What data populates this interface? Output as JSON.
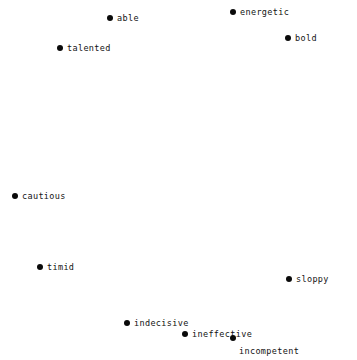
{
  "chart_data": {
    "type": "scatter",
    "title": "",
    "subtitle": "",
    "xlabel": "",
    "ylabel": "",
    "xlim": [
      0,
      357
    ],
    "ylim": [
      0,
      360
    ],
    "grid": false,
    "legend": "none",
    "axes_visible": false,
    "background_color": "#ffffff",
    "marker_color": "#0a0a0a",
    "marker_size_px": 6,
    "label_color": "#131313",
    "points": [
      {
        "label": "able",
        "x": 110,
        "y": 18,
        "label_position": "right"
      },
      {
        "label": "energetic",
        "x": 233,
        "y": 12,
        "label_position": "right"
      },
      {
        "label": "bold",
        "x": 288,
        "y": 38,
        "label_position": "right"
      },
      {
        "label": "talented",
        "x": 60,
        "y": 48,
        "label_position": "right"
      },
      {
        "label": "cautious",
        "x": 15,
        "y": 196,
        "label_position": "right"
      },
      {
        "label": "timid",
        "x": 40,
        "y": 267,
        "label_position": "right"
      },
      {
        "label": "sloppy",
        "x": 289,
        "y": 279,
        "label_position": "right"
      },
      {
        "label": "indecisive",
        "x": 127,
        "y": 323,
        "label_position": "right"
      },
      {
        "label": "ineffective",
        "x": 185,
        "y": 334,
        "label_position": "right"
      },
      {
        "label": "incompetent",
        "x": 233,
        "y": 338,
        "label_position": "below-right"
      }
    ]
  }
}
